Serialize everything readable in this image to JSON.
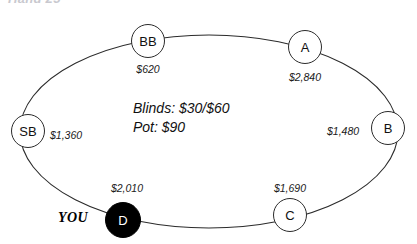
{
  "heading": {
    "text": "Hand 25"
  },
  "table": {
    "blinds_label": "Blinds: $30/$60",
    "pot_label": "Pot: $90",
    "hero_marker": "YOU",
    "ellipse_color": "#2b2b2b",
    "dealer_fill": "#000000",
    "seat_fill": "#ffffff"
  },
  "seats": [
    {
      "id": "bb",
      "label": "BB",
      "stack": "$620",
      "is_hero": false
    },
    {
      "id": "a",
      "label": "A",
      "stack": "$2,840",
      "is_hero": false
    },
    {
      "id": "b",
      "label": "B",
      "stack": "$1,480",
      "is_hero": false
    },
    {
      "id": "c",
      "label": "C",
      "stack": "$1,690",
      "is_hero": false
    },
    {
      "id": "d",
      "label": "D",
      "stack": "$2,010",
      "is_hero": true
    },
    {
      "id": "sb",
      "label": "SB",
      "stack": "$1,360",
      "is_hero": false
    }
  ]
}
